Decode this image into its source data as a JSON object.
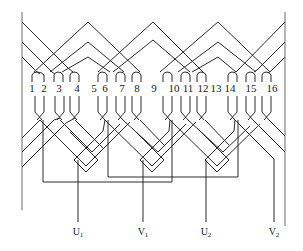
{
  "diagram": {
    "title": "",
    "slots": [
      {
        "number": "1",
        "x": 32
      },
      {
        "number": "2",
        "x": 44
      },
      {
        "number": "3",
        "x": 59
      },
      {
        "number": "4",
        "x": 77
      },
      {
        "number": "5",
        "x": 94
      },
      {
        "number": "6",
        "x": 105
      },
      {
        "number": "7",
        "x": 122
      },
      {
        "number": "8",
        "x": 137
      },
      {
        "number": "9",
        "x": 154
      },
      {
        "number": "10",
        "x": 174
      },
      {
        "number": "11",
        "x": 188
      },
      {
        "number": "12",
        "x": 203
      },
      {
        "number": "13",
        "x": 216
      },
      {
        "number": "14",
        "x": 230
      },
      {
        "number": "15",
        "x": 251
      },
      {
        "number": "16",
        "x": 272
      }
    ],
    "leads": [
      {
        "id": "U1",
        "base": "U",
        "sub": "1",
        "x": 78
      },
      {
        "id": "V1",
        "base": "V",
        "sub": "1",
        "x": 143
      },
      {
        "id": "U2",
        "base": "U",
        "sub": "2",
        "x": 206
      },
      {
        "id": "V2",
        "base": "V",
        "sub": "2",
        "x": 274
      }
    ],
    "colors": {
      "line": "#2a2a2a",
      "edge": "#6a6a6a",
      "background": "#ffffff"
    }
  }
}
